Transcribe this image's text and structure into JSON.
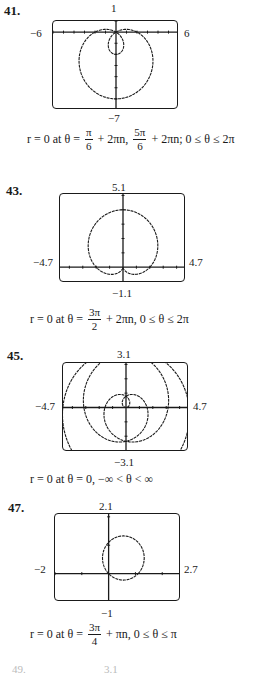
{
  "chart_data": [
    {
      "type": "line",
      "problem": "41.",
      "window": {
        "xmin": -6,
        "xmax": 6,
        "ymin": -7,
        "ymax": 1
      },
      "tick_labels": {
        "top": "1",
        "bottom": "−7",
        "left": "−6",
        "right": "6"
      },
      "curve": "limaçon with inner loop: r = 2 − 4 sin θ",
      "answer": {
        "prefix": "r = 0 at θ = ",
        "terms": [
          {
            "num": "π",
            "den": "6",
            "suffix": " + 2πn, "
          },
          {
            "num": "5π",
            "den": "6",
            "suffix": " + 2πn; 0 ≤ θ ≤ 2π"
          }
        ]
      }
    },
    {
      "type": "line",
      "problem": "43.",
      "window": {
        "xmin": -4.7,
        "xmax": 4.7,
        "ymin": -1.1,
        "ymax": 5.1
      },
      "tick_labels": {
        "top": "5.1",
        "bottom": "−1.1",
        "left": "−4.7",
        "right": "4.7"
      },
      "curve": "cardioid: r = 2 + 2 sin θ",
      "answer": {
        "prefix": "r = 0 at θ = ",
        "terms": [
          {
            "num": "3π",
            "den": "2",
            "suffix": " + 2πn, 0 ≤ θ ≤ 2π"
          }
        ]
      }
    },
    {
      "type": "line",
      "problem": "45.",
      "window": {
        "xmin": -4.7,
        "xmax": 4.7,
        "ymin": -3.1,
        "ymax": 3.1
      },
      "tick_labels": {
        "top": "3.1",
        "bottom": "−3.1",
        "left": "−4.7",
        "right": "4.7"
      },
      "curve": "spiral: r = θ / 2",
      "answer": {
        "text": "r = 0 at θ = 0, −∞ < θ < ∞"
      }
    },
    {
      "type": "line",
      "problem": "47.",
      "window": {
        "xmin": -2,
        "xmax": 2.7,
        "ymin": -1,
        "ymax": 2.1
      },
      "tick_labels": {
        "top": "2.1",
        "bottom": "−1",
        "left": "−2",
        "right": "2.7"
      },
      "curve": "circle: r = cos θ + sin θ (scaled)",
      "answer": {
        "prefix": "r = 0 at θ = ",
        "terms": [
          {
            "num": "3π",
            "den": "4",
            "suffix": " + πn, 0 ≤ θ ≤ π"
          }
        ]
      }
    }
  ],
  "cutoff": {
    "problem": "49.",
    "top": "3.1"
  }
}
